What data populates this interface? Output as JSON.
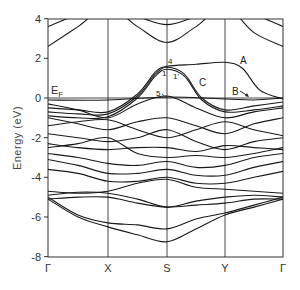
{
  "chart_data": {
    "type": "line",
    "title": "",
    "xlabel": "",
    "ylabel": "Energy (eV)",
    "ylim": [
      -8,
      4
    ],
    "yticks": [
      4,
      2,
      0,
      -2,
      -4,
      -6,
      -8
    ],
    "ytick_labels": [
      "4",
      "2",
      "0",
      "-2",
      "-4",
      "-6",
      "-8"
    ],
    "kpoints": [
      "Γ",
      "X",
      "S",
      "Y",
      "Γ"
    ],
    "kpoint_positions": [
      0,
      1,
      2,
      3,
      4
    ],
    "grid": "vertical lines at high-symmetry points",
    "fermi_level": {
      "label": "E",
      "subscript": "F",
      "energy": 0
    },
    "annotations": [
      {
        "text": "A",
        "near": "band between S and Y at ~1.8 eV"
      },
      {
        "text": "B",
        "near": "band just below E_F between Y and Γ, with arrow"
      },
      {
        "text": "C",
        "near": "band crossing E_F between S and Y"
      },
      {
        "text": "1",
        "near": "S, ~1.3 eV"
      },
      {
        "text": "1'",
        "near": "right of S, ~1.3 eV"
      },
      {
        "text": "4",
        "near": "S, ~1.7 eV"
      },
      {
        "text": "5",
        "near": "S, ~0.1 eV"
      }
    ],
    "series": [
      {
        "name": "conduction-1",
        "x": [
          0,
          0.5,
          1,
          1.5,
          2,
          2.5,
          3,
          3.5,
          4
        ],
        "values": [
          3.6,
          4.2,
          4.5,
          4.1,
          3.7,
          4.1,
          4.5,
          4.2,
          3.6
        ]
      },
      {
        "name": "conduction-2",
        "x": [
          0,
          0.5,
          1,
          1.5,
          2,
          2.5,
          3,
          3.5,
          4
        ],
        "values": [
          2.6,
          3.6,
          4.6,
          3.6,
          2.8,
          3.6,
          4.6,
          3.3,
          2.6
        ]
      },
      {
        "name": "band-A",
        "x": [
          0,
          0.5,
          1,
          1.5,
          1.8,
          2,
          2.5,
          3,
          3.3,
          3.6,
          4
        ],
        "values": [
          -0.5,
          -0.6,
          -0.7,
          0.2,
          1.3,
          1.6,
          1.7,
          1.8,
          1.5,
          0.4,
          -0.05
        ]
      },
      {
        "name": "band-C",
        "x": [
          0,
          0.5,
          1,
          1.5,
          1.8,
          2,
          2.3,
          2.6,
          3,
          3.5,
          4
        ],
        "values": [
          -0.7,
          -0.8,
          -0.8,
          0.1,
          1.2,
          1.55,
          1.2,
          0,
          -0.6,
          -0.4,
          -0.2
        ]
      },
      {
        "name": "band-1",
        "x": [
          0,
          0.5,
          1,
          1.5,
          1.8,
          2,
          2.3,
          2.6,
          3,
          3.5,
          4
        ],
        "values": [
          -0.9,
          -1.0,
          -0.95,
          0,
          1.1,
          1.45,
          1.1,
          -0.1,
          -0.7,
          -0.6,
          -0.4
        ]
      },
      {
        "name": "band-B",
        "x": [
          0,
          1,
          2,
          3,
          3.5,
          4
        ],
        "values": [
          -0.1,
          -0.1,
          0.05,
          -0.05,
          -0.1,
          0.0
        ]
      },
      {
        "name": "band-5",
        "x": [
          0,
          0.5,
          1,
          1.5,
          2,
          2.5,
          3,
          3.5,
          4
        ],
        "values": [
          -0.3,
          -0.6,
          -1.0,
          -0.3,
          0.1,
          -0.5,
          -1.0,
          -0.7,
          -0.5
        ]
      },
      {
        "name": "valence-1",
        "x": [
          0,
          0.5,
          1,
          1.5,
          2,
          2.5,
          3,
          3.5,
          4
        ],
        "values": [
          -1.0,
          -1.3,
          -1.6,
          -1.2,
          -1.0,
          -1.4,
          -1.8,
          -1.3,
          -1.0
        ]
      },
      {
        "name": "valence-2",
        "x": [
          0,
          0.5,
          1,
          1.5,
          2,
          2.5,
          3,
          3.5,
          4
        ],
        "values": [
          -1.4,
          -1.2,
          -1.1,
          -1.6,
          -2.0,
          -1.6,
          -1.2,
          -1.6,
          -1.9
        ]
      },
      {
        "name": "valence-3",
        "x": [
          0,
          0.5,
          1,
          1.5,
          2,
          2.5,
          3,
          3.5,
          4
        ],
        "values": [
          -1.8,
          -2.0,
          -2.2,
          -2.0,
          -1.6,
          -2.2,
          -2.6,
          -2.2,
          -2.0
        ]
      },
      {
        "name": "valence-4",
        "x": [
          0,
          0.5,
          1,
          1.5,
          2,
          2.5,
          3,
          3.5,
          4
        ],
        "values": [
          -2.3,
          -2.5,
          -2.6,
          -2.5,
          -2.5,
          -2.7,
          -2.4,
          -2.5,
          -2.6
        ]
      },
      {
        "name": "valence-5",
        "x": [
          0,
          0.5,
          1,
          1.5,
          2,
          2.5,
          3,
          3.5,
          4
        ],
        "values": [
          -2.5,
          -2.3,
          -2.0,
          -2.8,
          -3.0,
          -2.9,
          -3.0,
          -2.8,
          -2.5
        ]
      },
      {
        "name": "valence-6",
        "x": [
          0,
          0.5,
          1,
          1.5,
          2,
          2.5,
          3,
          3.5,
          4
        ],
        "values": [
          -2.8,
          -3.0,
          -3.3,
          -3.4,
          -3.2,
          -3.5,
          -3.4,
          -3.0,
          -2.8
        ]
      },
      {
        "name": "valence-7",
        "x": [
          0,
          0.5,
          1,
          1.5,
          2,
          2.5,
          3,
          3.5,
          4
        ],
        "values": [
          -3.1,
          -3.4,
          -3.8,
          -3.8,
          -3.6,
          -3.9,
          -3.9,
          -3.5,
          -3.2
        ]
      },
      {
        "name": "valence-8",
        "x": [
          0,
          0.5,
          1,
          1.5,
          2,
          2.5,
          3,
          3.5,
          4
        ],
        "values": [
          -3.6,
          -3.8,
          -4.2,
          -4.2,
          -4.0,
          -4.3,
          -4.3,
          -4.0,
          -3.7
        ]
      },
      {
        "name": "valence-9",
        "x": [
          0,
          0.5,
          1,
          1.5,
          2,
          2.5,
          3,
          3.5,
          4
        ],
        "values": [
          -4.7,
          -4.8,
          -4.7,
          -4.3,
          -4.1,
          -4.5,
          -4.6,
          -4.7,
          -4.8
        ]
      },
      {
        "name": "valence-10",
        "x": [
          0,
          0.5,
          1,
          1.5,
          2,
          2.5,
          3,
          3.5,
          4
        ],
        "values": [
          -4.9,
          -4.75,
          -4.8,
          -5.1,
          -5.5,
          -5.2,
          -5.0,
          -4.9,
          -5.0
        ]
      },
      {
        "name": "valence-11",
        "x": [
          0,
          0.5,
          1,
          1.5,
          2,
          2.5,
          3,
          3.5,
          4
        ],
        "values": [
          -5.1,
          -5.0,
          -5.0,
          -5.3,
          -5.5,
          -5.4,
          -5.3,
          -5.1,
          -5.1
        ]
      },
      {
        "name": "valence-12",
        "x": [
          0,
          0.5,
          1,
          1.5,
          2,
          2.5,
          3,
          3.5,
          4
        ],
        "values": [
          -5.0,
          -5.9,
          -6.3,
          -6.4,
          -6.6,
          -6.1,
          -5.8,
          -5.4,
          -5.0
        ]
      },
      {
        "name": "valence-13",
        "x": [
          0,
          0.5,
          1,
          1.5,
          2,
          2.5,
          3,
          3.5,
          4
        ],
        "values": [
          -5.1,
          -6.0,
          -6.5,
          -6.9,
          -7.25,
          -6.6,
          -5.9,
          -5.5,
          -5.1
        ]
      }
    ]
  }
}
